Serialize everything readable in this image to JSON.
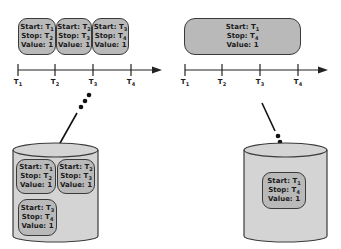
{
  "left_panel": {
    "segments": [
      {
        "start": "T1",
        "stop": "T2",
        "value": "1"
      },
      {
        "start": "T2",
        "stop": "T3",
        "value": "1"
      },
      {
        "start": "T3",
        "stop": "T4",
        "value": "1"
      }
    ],
    "axis_ticks": [
      "T1",
      "T2",
      "T3",
      "T4"
    ],
    "storage_records": [
      {
        "start": "T1",
        "stop": "T2",
        "value": "1"
      },
      {
        "start": "T2",
        "stop": "T3",
        "value": "1"
      },
      {
        "start": "T3",
        "stop": "T4",
        "value": "1"
      }
    ]
  },
  "right_panel": {
    "segments": [
      {
        "start": "T1",
        "stop": "T4",
        "value": "1"
      }
    ],
    "axis_ticks": [
      "T1",
      "T2",
      "T3",
      "T4"
    ],
    "storage_records": [
      {
        "start": "T1",
        "stop": "T4",
        "value": "1"
      }
    ]
  },
  "labels": {
    "start": "Start:",
    "stop": "Stop:",
    "value": "Value:"
  },
  "colors": {
    "fill": "#b9b9b9",
    "cylinder_fill": "#d4d4d4",
    "stroke": "#3a3a3a"
  }
}
